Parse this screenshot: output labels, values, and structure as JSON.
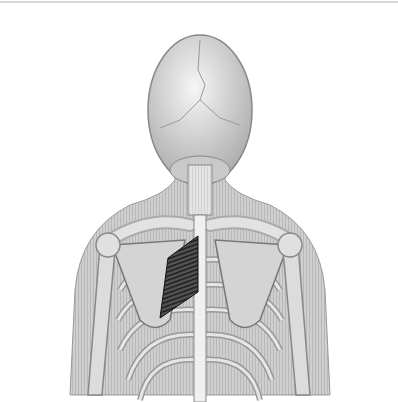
{
  "figure": {
    "highlight_color": "#2a2a2a",
    "bone_color": "#d9d9d9",
    "skin_color": "#bdbdbd"
  }
}
